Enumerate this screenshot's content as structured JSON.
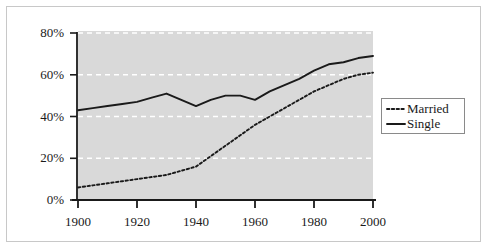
{
  "chart_data": {
    "type": "line",
    "title": "",
    "subtitle": "",
    "xlabel": "",
    "ylabel": "",
    "xlim": [
      1900,
      2000
    ],
    "ylim": [
      0,
      80
    ],
    "grid": true,
    "grid_orientation": "horizontal",
    "legend_position": "right",
    "x_ticks": [
      "1900",
      "1920",
      "1940",
      "1960",
      "1980",
      "2000"
    ],
    "x_tick_values": [
      1900,
      1920,
      1940,
      1960,
      1980,
      2000
    ],
    "y_ticks": [
      "0%",
      "20%",
      "40%",
      "60%",
      "80%"
    ],
    "y_tick_values": [
      0,
      20,
      40,
      60,
      80
    ],
    "x": [
      1900,
      1905,
      1910,
      1915,
      1920,
      1925,
      1930,
      1935,
      1940,
      1945,
      1950,
      1955,
      1960,
      1965,
      1970,
      1975,
      1980,
      1985,
      1990,
      1995,
      2000
    ],
    "series": [
      {
        "name": "Married",
        "style": "dotted",
        "color": "#1a1a1a",
        "values": [
          6,
          7,
          8,
          9,
          10,
          11,
          12,
          14,
          16,
          21,
          26,
          31,
          36,
          40,
          44,
          48,
          52,
          55,
          58,
          60,
          61
        ]
      },
      {
        "name": "Single",
        "style": "solid",
        "color": "#1a1a1a",
        "values": [
          43,
          44,
          45,
          46,
          47,
          49,
          51,
          48,
          45,
          48,
          50,
          50,
          48,
          52,
          55,
          58,
          62,
          65,
          66,
          68,
          69
        ]
      }
    ],
    "colors": {
      "plot_background": "#d9d9d9",
      "grid_line": "#ffffff",
      "axis_line": "#1a1a1a",
      "figure_background": "#ffffff",
      "frame_border": "#c8c8c8",
      "legend_border": "#8a8a8a",
      "text": "#1a1a1a"
    }
  },
  "legend": {
    "entries": [
      {
        "label": "Married"
      },
      {
        "label": "Single"
      }
    ]
  }
}
